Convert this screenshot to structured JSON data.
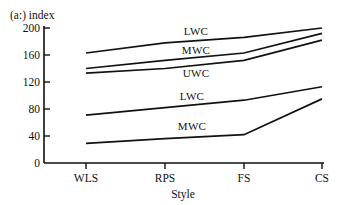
{
  "chart_data": {
    "type": "line",
    "title": "(a:) index",
    "xlabel": "Style",
    "ylabel": "",
    "categories": [
      "WLS",
      "RPS",
      "FS",
      "CS"
    ],
    "ylim": [
      0,
      200
    ],
    "yticks": [
      0,
      40,
      80,
      120,
      160,
      200
    ],
    "grid": false,
    "legend_position": "inline-labels",
    "series": [
      {
        "name": "LWC",
        "label": "LWC",
        "group": "upper",
        "values": [
          163,
          178,
          186,
          200
        ]
      },
      {
        "name": "MWC",
        "label": "MWC",
        "group": "upper",
        "values": [
          140,
          152,
          163,
          192
        ]
      },
      {
        "name": "UWC",
        "label": "UWC",
        "group": "upper",
        "values": [
          133,
          140,
          152,
          182
        ]
      },
      {
        "name": "LWC-lower",
        "label": "LWC",
        "group": "lower",
        "values": [
          71,
          82,
          93,
          113
        ]
      },
      {
        "name": "MWC-lower",
        "label": "MWC",
        "group": "lower",
        "values": [
          29,
          36,
          42,
          95
        ]
      }
    ],
    "annotations": [
      {
        "text": "LWC",
        "series": "LWC",
        "x": 196,
        "y": 35
      },
      {
        "text": "MWC",
        "series": "MWC",
        "x": 196,
        "y": 54
      },
      {
        "text": "UWC",
        "series": "UWC",
        "x": 196,
        "y": 77
      },
      {
        "text": "LWC",
        "series": "LWC-lower",
        "x": 192,
        "y": 100
      },
      {
        "text": "MWC",
        "series": "MWC-lower",
        "x": 192,
        "y": 130
      }
    ],
    "colors": {
      "line": "#111111",
      "axis": "#111111",
      "background": "#ffffff"
    }
  },
  "yticks": {
    "t0": "0",
    "t40": "40",
    "t80": "80",
    "t120": "120",
    "t160": "160",
    "t200": "200"
  },
  "xticks": {
    "c0": "WLS",
    "c1": "RPS",
    "c2": "FS",
    "c3": "CS"
  },
  "labels": {
    "title": "(a:) index",
    "xaxis_title": "Style",
    "upper_lwc": "LWC",
    "upper_mwc": "MWC",
    "upper_uwc": "UWC",
    "lower_lwc": "LWC",
    "lower_mwc": "MWC"
  }
}
